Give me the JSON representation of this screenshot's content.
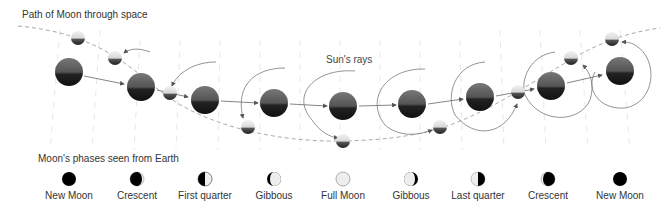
{
  "labels": {
    "path_of_moon": "Path of Moon through space",
    "suns_rays": "Sun's rays",
    "phases_title": "Moon's phases seen from Earth"
  },
  "colors": {
    "earth_dark": "#1a1a1a",
    "earth_mid": "#6a6a6a",
    "moon_light": "#e8e8e8",
    "orbit_line": "#777777",
    "path_dash": "#aaaaaa",
    "rays": "#e6e6e6"
  },
  "phases": [
    {
      "name": "New Moon",
      "type": "new"
    },
    {
      "name": "Crescent",
      "type": "waxing-crescent"
    },
    {
      "name": "First quarter",
      "type": "first-quarter"
    },
    {
      "name": "Gibbous",
      "type": "waxing-gibbous"
    },
    {
      "name": "Full Moon",
      "type": "full"
    },
    {
      "name": "Gibbous",
      "type": "waning-gibbous"
    },
    {
      "name": "Last quarter",
      "type": "last-quarter"
    },
    {
      "name": "Crescent",
      "type": "waning-crescent"
    },
    {
      "name": "New Moon",
      "type": "new"
    }
  ]
}
